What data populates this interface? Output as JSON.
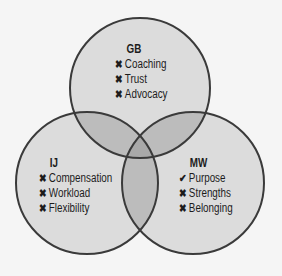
{
  "diagram": {
    "type": "venn-3",
    "colors": {
      "background": "#f5f5f5",
      "single": "#dcdcdc",
      "double": "#bcbcbc",
      "triple": "#a9a9a9",
      "stroke": "#3a3a3a",
      "text": "#1c1c1c"
    },
    "sets": [
      {
        "id": "GB",
        "title": "GB",
        "position": "top",
        "circle": {
          "cx": 140,
          "cy": 88,
          "r": 70
        },
        "items": [
          {
            "mark": "cross",
            "glyph": "✖",
            "label": "Coaching"
          },
          {
            "mark": "cross",
            "glyph": "✖",
            "label": "Trust"
          },
          {
            "mark": "cross",
            "glyph": "✖",
            "label": "Advocacy"
          }
        ]
      },
      {
        "id": "IJ",
        "title": "IJ",
        "position": "bottom-left",
        "circle": {
          "cx": 87,
          "cy": 183,
          "r": 71
        },
        "items": [
          {
            "mark": "cross",
            "glyph": "✖",
            "label": "Compensation"
          },
          {
            "mark": "cross",
            "glyph": "✖",
            "label": "Workload"
          },
          {
            "mark": "cross",
            "glyph": "✖",
            "label": "Flexibility"
          }
        ]
      },
      {
        "id": "MW",
        "title": "MW",
        "position": "bottom-right",
        "circle": {
          "cx": 193,
          "cy": 183,
          "r": 71
        },
        "items": [
          {
            "mark": "check",
            "glyph": "✔",
            "label": "Purpose"
          },
          {
            "mark": "cross",
            "glyph": "✖",
            "label": "Strengths"
          },
          {
            "mark": "cross",
            "glyph": "✖",
            "label": "Belonging"
          }
        ]
      }
    ]
  }
}
